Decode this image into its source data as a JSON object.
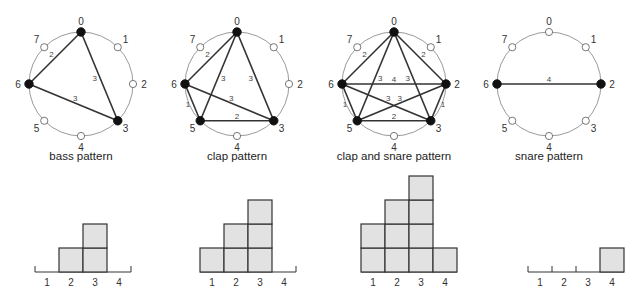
{
  "diagrams": [
    {
      "title": "bass pattern",
      "center": [
        81,
        84
      ],
      "radius": 52,
      "nodes": [
        "0",
        "1",
        "2",
        "3",
        "4",
        "5",
        "6",
        "7"
      ],
      "filled": [
        0,
        3,
        6
      ],
      "edges": [
        {
          "a": 0,
          "b": 6,
          "label": "2"
        },
        {
          "a": 0,
          "b": 3,
          "label": "3"
        },
        {
          "a": 6,
          "b": 3,
          "label": "3"
        }
      ],
      "histogram": {
        "x0": 35,
        "counts": [
          0,
          1,
          2,
          0
        ],
        "tick_labels": [
          "1",
          "2",
          "3",
          "4"
        ]
      }
    },
    {
      "title": "clap pattern",
      "center": [
        237,
        84
      ],
      "radius": 52,
      "nodes": [
        "0",
        "1",
        "2",
        "3",
        "4",
        "5",
        "6",
        "7"
      ],
      "filled": [
        0,
        3,
        5,
        6
      ],
      "edges": [
        {
          "a": 0,
          "b": 6,
          "label": "2"
        },
        {
          "a": 0,
          "b": 5,
          "label": "3"
        },
        {
          "a": 0,
          "b": 3,
          "label": "3"
        },
        {
          "a": 6,
          "b": 3,
          "label": "3"
        },
        {
          "a": 6,
          "b": 5,
          "label": "1"
        },
        {
          "a": 5,
          "b": 3,
          "label": "2"
        }
      ],
      "histogram": {
        "x0": 200,
        "counts": [
          1,
          2,
          3,
          0
        ],
        "tick_labels": [
          "1",
          "2",
          "3",
          "4"
        ]
      }
    },
    {
      "title": "clap and snare pattern",
      "center": [
        394,
        84
      ],
      "radius": 52,
      "nodes": [
        "0",
        "1",
        "2",
        "3",
        "4",
        "5",
        "6",
        "7"
      ],
      "filled": [
        0,
        2,
        3,
        5,
        6
      ],
      "edges": [
        {
          "a": 0,
          "b": 6,
          "label": "2"
        },
        {
          "a": 0,
          "b": 2,
          "label": "2"
        },
        {
          "a": 0,
          "b": 5,
          "label": "3"
        },
        {
          "a": 0,
          "b": 3,
          "label": "3"
        },
        {
          "a": 6,
          "b": 2,
          "label": "4"
        },
        {
          "a": 6,
          "b": 3,
          "label": "3"
        },
        {
          "a": 5,
          "b": 2,
          "label": "3"
        },
        {
          "a": 6,
          "b": 5,
          "label": "1"
        },
        {
          "a": 2,
          "b": 3,
          "label": "1"
        },
        {
          "a": 5,
          "b": 3,
          "label": "2"
        }
      ],
      "histogram": {
        "x0": 361,
        "counts": [
          2,
          3,
          4,
          1
        ],
        "tick_labels": [
          "1",
          "2",
          "3",
          "4"
        ]
      }
    },
    {
      "title": "snare pattern",
      "center": [
        549,
        84
      ],
      "radius": 52,
      "nodes": [
        "0",
        "1",
        "2",
        "3",
        "4",
        "5",
        "6",
        "7"
      ],
      "filled": [
        2,
        6
      ],
      "edges": [
        {
          "a": 6,
          "b": 2,
          "label": "4"
        }
      ],
      "histogram": {
        "x0": 528,
        "counts": [
          0,
          0,
          0,
          1
        ],
        "tick_labels": [
          "1",
          "2",
          "3",
          "4"
        ]
      }
    }
  ],
  "style": {
    "circle_color": "#9a9a9a",
    "edge_color": "#333333",
    "node_fill": "#111111",
    "node_empty_fill": "#ffffff",
    "bar_fill": "#e2e2e2",
    "bar_stroke": "#333333",
    "box_size": 24,
    "baseline_y": 272
  }
}
